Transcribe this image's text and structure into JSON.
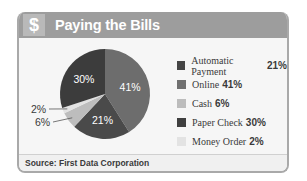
{
  "header": {
    "icon": "dollar-sign-icon",
    "icon_glyph": "$",
    "title": "Paying the Bills"
  },
  "footer": {
    "source": "Source: First Data Corporation"
  },
  "chart_data": {
    "type": "pie",
    "title": "Paying the Bills",
    "categories": [
      "Automatic Payment",
      "Online",
      "Cash",
      "Paper Check",
      "Money Order"
    ],
    "values": [
      21,
      41,
      6,
      30,
      2
    ],
    "labels": [
      "21%",
      "41%",
      "6%",
      "30%",
      "2%"
    ],
    "colors": [
      "#4a4a4a",
      "#6d6d6d",
      "#bdbdbd",
      "#3c3c3c",
      "#e2e2e2"
    ],
    "legend_position": "right",
    "legend": [
      {
        "label": "Automatic Payment",
        "value": "21%",
        "color": "#454545"
      },
      {
        "label": "Online",
        "value": "41%",
        "color": "#707070"
      },
      {
        "label": "Cash",
        "value": "6%",
        "color": "#bcbcbc"
      },
      {
        "label": "Paper Check",
        "value": "30%",
        "color": "#3f3f3f"
      },
      {
        "label": "Money Order",
        "value": "2%",
        "color": "#e3e3e3"
      }
    ],
    "source": "Source: First Data Corporation"
  }
}
